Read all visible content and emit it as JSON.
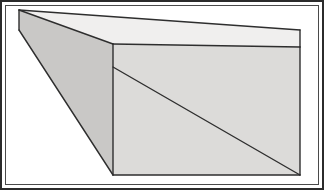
{
  "figure": {
    "canvas": {
      "width": 324,
      "height": 190,
      "background_color": "#ffffff"
    },
    "frame": {
      "outer": {
        "name": "outer-border",
        "color": "#2b2b2b",
        "thickness": 2,
        "x": 0,
        "y": 0,
        "width": 324,
        "height": 190
      },
      "inner": {
        "name": "inner-border",
        "color": "#4a4a4a",
        "thickness": 1,
        "x": 5,
        "y": 5,
        "width": 314,
        "height": 180
      }
    },
    "colors": {
      "top_face": "#f0efee",
      "front_face": "#dcdbd9",
      "side_face": "#c9c8c6",
      "outline": "#2e2e2e",
      "diagonal_line": "#2e2e2e",
      "background": "#ffffff"
    },
    "line_widths": {
      "outline": 1.4,
      "diagonal": 1.4
    },
    "vertices": {
      "apex_top": {
        "label": "A",
        "x": 19,
        "y": 10
      },
      "apex_bottom": {
        "label": "B",
        "x": 19,
        "y": 30
      },
      "front_top_left": {
        "label": "C",
        "x": 113,
        "y": 44
      },
      "front_bottom_left": {
        "label": "D",
        "x": 113,
        "y": 175
      },
      "front_top_right": {
        "label": "E",
        "x": 300,
        "y": 47
      },
      "front_bottom_right": {
        "label": "F",
        "x": 300,
        "y": 175
      },
      "top_back_right": {
        "label": "G",
        "x": 300,
        "y": 30
      },
      "diagonal_start": {
        "label": "H",
        "x": 113,
        "y": 67
      }
    },
    "faces": [
      {
        "name": "top-face",
        "fill": "#f0efee",
        "points": "19,10 300,30 300,47 113,44"
      },
      {
        "name": "side-face",
        "fill": "#c9c8c6",
        "points": "19,10 113,44 113,175 19,30"
      },
      {
        "name": "front-face",
        "fill": "#dcdbd9",
        "points": "113,44 300,47 300,175 113,175"
      }
    ],
    "edges": [
      {
        "name": "edge-apex-to-front-top-left",
        "points": "19,10 113,44"
      },
      {
        "name": "edge-apex-to-top-back-right",
        "points": "19,10 300,30"
      },
      {
        "name": "edge-top-back-right-to-front-top-right",
        "points": "300,30 300,47"
      },
      {
        "name": "edge-front-top-left-to-front-top-right",
        "points": "113,44 300,47"
      },
      {
        "name": "edge-front-top-left-to-front-bottom-left",
        "points": "113,44 113,175"
      },
      {
        "name": "edge-apex-bottom-to-front-bottom-left",
        "points": "19,30 113,175"
      },
      {
        "name": "edge-apex-top-to-apex-bottom",
        "points": "19,10 19,30"
      },
      {
        "name": "edge-front-bottom-left-to-front-bottom-right",
        "points": "113,175 300,175"
      },
      {
        "name": "edge-front-top-right-to-front-bottom-right",
        "points": "300,47 300,175"
      }
    ],
    "construction_lines": [
      {
        "name": "front-face-diagonal",
        "points": "113,67 300,175",
        "color": "#2e2e2e",
        "width": 1.4
      }
    ]
  }
}
